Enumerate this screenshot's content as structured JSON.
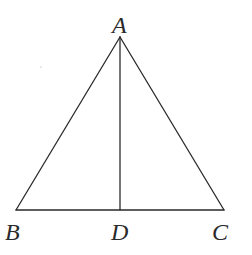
{
  "diagram": {
    "type": "geometry",
    "points": {
      "A": {
        "label": "A",
        "x": 120,
        "y": 37
      },
      "B": {
        "label": "B",
        "x": 16,
        "y": 210
      },
      "C": {
        "label": "C",
        "x": 224,
        "y": 210
      },
      "D": {
        "label": "D",
        "x": 120,
        "y": 210
      }
    },
    "segments": [
      "AB",
      "AC",
      "BC",
      "AD"
    ],
    "colors": {
      "stroke": "#2a2a2a",
      "background": "#ffffff"
    }
  }
}
